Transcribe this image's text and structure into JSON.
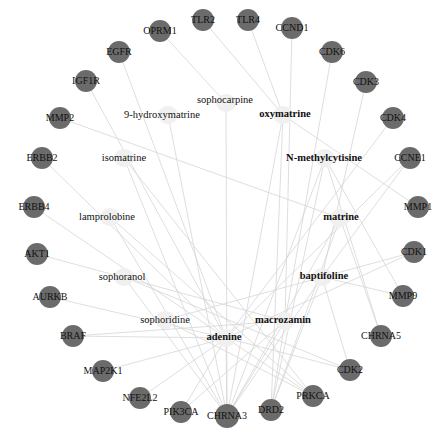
{
  "diagram": {
    "type": "compound-target network",
    "colors": {
      "target_node": "#6b6b6b",
      "compound_node": "#f0f0f0",
      "edge": "#d6d6d6",
      "text": "#111111"
    },
    "targets": [
      {
        "id": "TLR2",
        "label": "TLR2",
        "x": 203,
        "y": 20,
        "r": 11
      },
      {
        "id": "TLR4",
        "label": "TLR4",
        "x": 248,
        "y": 20,
        "r": 11
      },
      {
        "id": "CCND1",
        "label": "CCND1",
        "x": 292,
        "y": 28,
        "r": 11
      },
      {
        "id": "OPRM1",
        "label": "OPRM1",
        "x": 160,
        "y": 31,
        "r": 11
      },
      {
        "id": "CDK6",
        "label": "CDK6",
        "x": 332,
        "y": 52,
        "r": 11
      },
      {
        "id": "EGFR",
        "label": "EGFR",
        "x": 119,
        "y": 52,
        "r": 11
      },
      {
        "id": "CDK3",
        "label": "CDK3",
        "x": 366,
        "y": 82,
        "r": 11
      },
      {
        "id": "IGF1R",
        "label": "IGF1R",
        "x": 86,
        "y": 81,
        "r": 11
      },
      {
        "id": "CDK4",
        "label": "CDK4",
        "x": 393,
        "y": 118,
        "r": 11
      },
      {
        "id": "MMP2",
        "label": "MMP2",
        "x": 60,
        "y": 118,
        "r": 11
      },
      {
        "id": "ERBB2",
        "label": "ERBB2",
        "x": 42,
        "y": 158,
        "r": 11
      },
      {
        "id": "CCNE1",
        "label": "CCNE1",
        "x": 410,
        "y": 158,
        "r": 11
      },
      {
        "id": "ERBB4",
        "label": "ERBB4",
        "x": 34,
        "y": 207,
        "r": 11
      },
      {
        "id": "MMP1",
        "label": "MMP1",
        "x": 418,
        "y": 207,
        "r": 11
      },
      {
        "id": "AKT1",
        "label": "AKT1",
        "x": 37,
        "y": 254,
        "r": 11
      },
      {
        "id": "CDK1",
        "label": "CDK1",
        "x": 414,
        "y": 252,
        "r": 11
      },
      {
        "id": "AURKB",
        "label": "AURKB",
        "x": 50,
        "y": 297,
        "r": 11
      },
      {
        "id": "MMP9",
        "label": "MMP9",
        "x": 403,
        "y": 296,
        "r": 11
      },
      {
        "id": "BRAF",
        "label": "BRAF",
        "x": 73,
        "y": 336,
        "r": 11
      },
      {
        "id": "CHRNA5",
        "label": "CHRNA5",
        "x": 381,
        "y": 336,
        "r": 11
      },
      {
        "id": "MAP2K1",
        "label": "MAP2K1",
        "x": 103,
        "y": 371,
        "r": 11
      },
      {
        "id": "CDK2",
        "label": "CDK2",
        "x": 350,
        "y": 370,
        "r": 11
      },
      {
        "id": "NFE2L2",
        "label": "NFE2L2",
        "x": 140,
        "y": 398,
        "r": 11
      },
      {
        "id": "PRKCA",
        "label": "PRKCA",
        "x": 313,
        "y": 396,
        "r": 11
      },
      {
        "id": "PIK3CA",
        "label": "PIK3CA",
        "x": 181,
        "y": 412,
        "r": 11
      },
      {
        "id": "DRD2",
        "label": "DRD2",
        "x": 271,
        "y": 410,
        "r": 11
      },
      {
        "id": "CHRNA3",
        "label": "CHRNA3",
        "x": 227,
        "y": 416,
        "r": 12
      }
    ],
    "compounds": [
      {
        "id": "sophocarpine",
        "label": "sophocarpine",
        "x": 225,
        "y": 100,
        "bold": false,
        "node_x": 226,
        "node_y": 103
      },
      {
        "id": "9-hydroxymatrine",
        "label": "9-hydroxymatrine",
        "x": 162,
        "y": 115,
        "bold": false,
        "node_x": 168,
        "node_y": 115
      },
      {
        "id": "oxymatrine",
        "label": "oxymatrine",
        "x": 285,
        "y": 114,
        "bold": true,
        "node_x": 283,
        "node_y": 115
      },
      {
        "id": "isomatrine",
        "label": "isomatrine",
        "x": 124,
        "y": 158,
        "bold": false,
        "node_x": 124,
        "node_y": 158
      },
      {
        "id": "N-methylcytisine",
        "label": "N-methylcytisine",
        "x": 324,
        "y": 158,
        "bold": true,
        "node_x": 325,
        "node_y": 158
      },
      {
        "id": "lamprolobine",
        "label": "lamprolobine",
        "x": 107,
        "y": 217,
        "bold": false,
        "node_x": 110,
        "node_y": 217
      },
      {
        "id": "matrine",
        "label": "matrine",
        "x": 341,
        "y": 217,
        "bold": true,
        "node_x": 340,
        "node_y": 218
      },
      {
        "id": "sophoranol",
        "label": "sophoranol",
        "x": 122,
        "y": 277,
        "bold": false,
        "node_x": 124,
        "node_y": 277
      },
      {
        "id": "baptifoline",
        "label": "baptifoline",
        "x": 324,
        "y": 276,
        "bold": true,
        "node_x": 322,
        "node_y": 277
      },
      {
        "id": "sophoridine",
        "label": "sophoridine",
        "x": 165,
        "y": 320,
        "bold": false,
        "node_x": 165,
        "node_y": 320
      },
      {
        "id": "macrozamin",
        "label": "macrozamin",
        "x": 283,
        "y": 320,
        "bold": true,
        "node_x": 285,
        "node_y": 321
      },
      {
        "id": "adenine",
        "label": "adenine",
        "x": 224,
        "y": 337,
        "bold": true,
        "node_x": 226,
        "node_y": 338
      }
    ],
    "edges": [
      [
        "OPRM1",
        "sophocarpine"
      ],
      [
        "TLR4",
        "oxymatrine"
      ],
      [
        "TLR2",
        "oxymatrine"
      ],
      [
        "CCND1",
        "macrozamin"
      ],
      [
        "CDK6",
        "macrozamin"
      ],
      [
        "CDK3",
        "baptifoline"
      ],
      [
        "CDK4",
        "adenine"
      ],
      [
        "EGFR",
        "adenine"
      ],
      [
        "IGF1R",
        "adenine"
      ],
      [
        "MMP2",
        "matrine"
      ],
      [
        "ERBB2",
        "adenine"
      ],
      [
        "ERBB4",
        "adenine"
      ],
      [
        "AKT1",
        "macrozamin"
      ],
      [
        "AURKB",
        "adenine"
      ],
      [
        "BRAF",
        "adenine"
      ],
      [
        "MAP2K1",
        "adenine"
      ],
      [
        "NFE2L2",
        "adenine"
      ],
      [
        "PIK3CA",
        "adenine"
      ],
      [
        "CHRNA3",
        "adenine"
      ],
      [
        "DRD2",
        "macrozamin"
      ],
      [
        "PRKCA",
        "adenine"
      ],
      [
        "CDK2",
        "adenine"
      ],
      [
        "CHRNA5",
        "N-methylcytisine"
      ],
      [
        "MMP9",
        "N-methylcytisine"
      ],
      [
        "CDK1",
        "adenine"
      ],
      [
        "MMP1",
        "oxymatrine"
      ],
      [
        "CCNE1",
        "adenine"
      ],
      [
        "CHRNA3",
        "sophocarpine"
      ],
      [
        "CHRNA3",
        "9-hydroxymatrine"
      ],
      [
        "CHRNA3",
        "isomatrine"
      ],
      [
        "CHRNA3",
        "lamprolobine"
      ],
      [
        "CHRNA3",
        "sophoranol"
      ],
      [
        "CHRNA3",
        "N-methylcytisine"
      ],
      [
        "CHRNA3",
        "matrine"
      ],
      [
        "CHRNA3",
        "baptifoline"
      ],
      [
        "CHRNA3",
        "macrozamin"
      ],
      [
        "CHRNA3",
        "oxymatrine"
      ],
      [
        "DRD2",
        "N-methylcytisine"
      ],
      [
        "DRD2",
        "matrine"
      ],
      [
        "DRD2",
        "baptifoline"
      ],
      [
        "DRD2",
        "oxymatrine"
      ],
      [
        "PRKCA",
        "sophoridine"
      ],
      [
        "PRKCA",
        "isomatrine"
      ],
      [
        "PRKCA",
        "lamprolobine"
      ],
      [
        "CDK2",
        "sophoranol"
      ],
      [
        "CHRNA5",
        "matrine"
      ],
      [
        "MMP9",
        "baptifoline"
      ],
      [
        "PIK3CA",
        "macrozamin"
      ],
      [
        "CDK1",
        "sophoridine"
      ],
      [
        "CCNE1",
        "baptifoline"
      ],
      [
        "BRAF",
        "macrozamin"
      ],
      [
        "CDK2",
        "baptifoline"
      ]
    ]
  }
}
